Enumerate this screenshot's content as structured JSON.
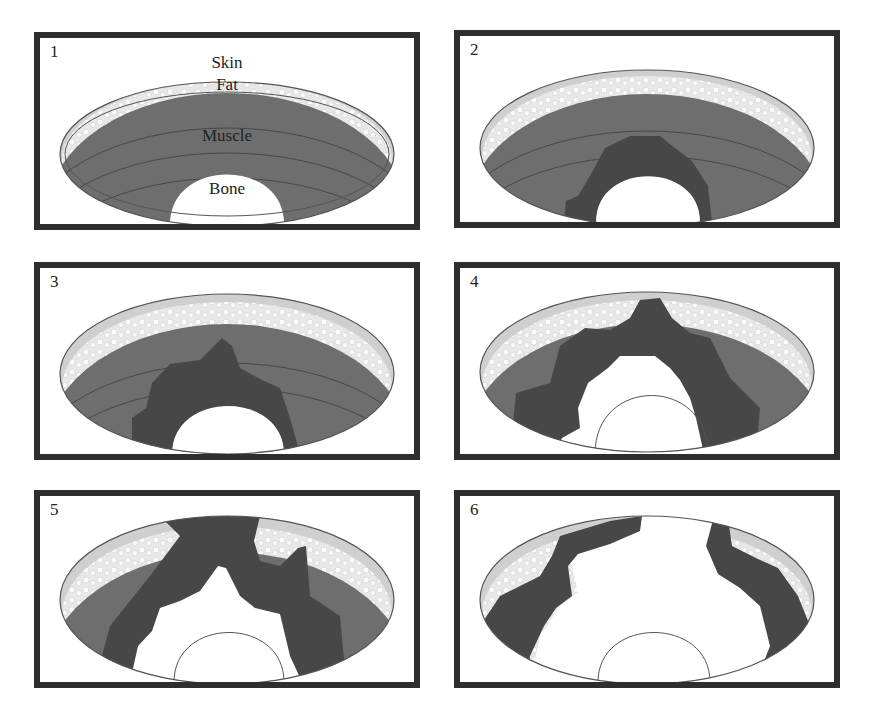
{
  "figure": {
    "layer_labels": {
      "skin": "Skin",
      "fat": "Fat",
      "muscle": "Muscle",
      "bone": "Bone"
    },
    "panels": [
      {
        "number": "1",
        "stage": "intact tissue layers"
      },
      {
        "number": "2",
        "stage": "damage zone around bone"
      },
      {
        "number": "3",
        "stage": "damage zone extends into muscle"
      },
      {
        "number": "4",
        "stage": "damage reaches fat layer; necrotic area near bone"
      },
      {
        "number": "5",
        "stage": "damage breaches skin; large necrotic area"
      },
      {
        "number": "6",
        "stage": "central tissue lost; damaged bands remain at edges"
      }
    ]
  },
  "colors": {
    "frame": "#2e2e2e",
    "skin": "#cfcfcf",
    "fat": "#e6e6e6",
    "muscle": "#6e6e6e",
    "damage": "#474747",
    "bone": "#ffffff",
    "outline": "#555555"
  }
}
